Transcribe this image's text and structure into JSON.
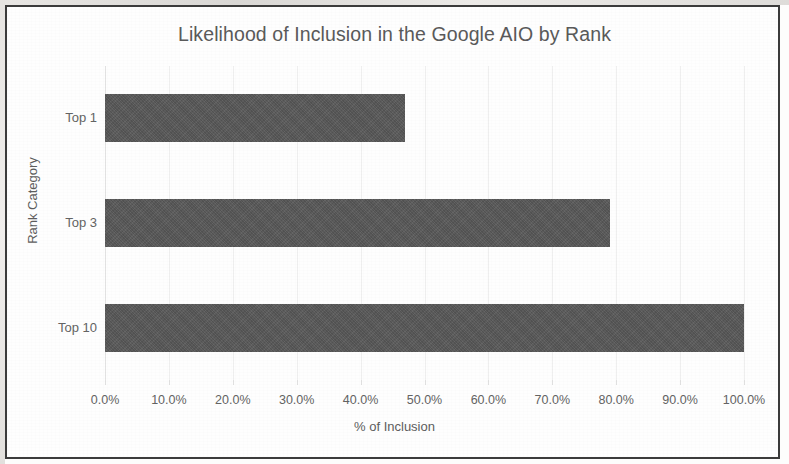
{
  "chart_data": {
    "type": "bar",
    "orientation": "horizontal",
    "title": "Likelihood of Inclusion in the Google AIO by Rank",
    "xlabel": "% of Inclusion",
    "ylabel": "Rank Category",
    "categories": [
      "Top 1",
      "Top 3",
      "Top 10"
    ],
    "values": [
      47,
      79,
      100
    ],
    "value_unit": "percent",
    "xlim": [
      0,
      100
    ],
    "xticks": [
      0,
      10,
      20,
      30,
      40,
      50,
      60,
      70,
      80,
      90,
      100
    ],
    "xtick_labels": [
      "0.0%",
      "10.0%",
      "20.0%",
      "30.0%",
      "40.0%",
      "50.0%",
      "60.0%",
      "70.0%",
      "80.0%",
      "90.0%",
      "100.0%"
    ],
    "grid": "vertical",
    "legend": "none",
    "series": [
      {
        "name": "% of Inclusion",
        "values": [
          47,
          79,
          100
        ]
      }
    ],
    "colors": {
      "bar": "#595959",
      "gridline": "#efefef",
      "text": "#5d5d5d",
      "title": "#5a5a5a",
      "frame": "#3b3b3b",
      "background": "#fefefe"
    }
  }
}
